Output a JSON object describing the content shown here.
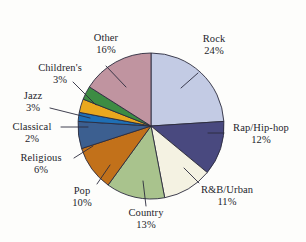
{
  "chart_data": {
    "type": "pie",
    "title": "",
    "subtitle": "",
    "xlabel": "",
    "ylabel": "",
    "units": "percent",
    "legend_position": "none",
    "grid": false,
    "labels_show_percent": true,
    "categories": [
      "Rock",
      "Rap/Hip-hop",
      "R&B/Urban",
      "Country",
      "Pop",
      "Religious",
      "Classical",
      "Jazz",
      "Children's",
      "Other"
    ],
    "values": [
      24,
      12,
      11,
      13,
      10,
      6,
      2,
      3,
      3,
      16
    ],
    "colors": [
      "#c3cbe4",
      "#49497f",
      "#f4f2e2",
      "#a9c38d",
      "#c2711a",
      "#3c5f90",
      "#1f6fb5",
      "#eaa81e",
      "#3d8c43",
      "#c094a0"
    ],
    "slices": [
      {
        "name": "Rock",
        "value": 24,
        "percent_label": "24%",
        "color": "#c3cbe4"
      },
      {
        "name": "Rap/Hip-hop",
        "value": 12,
        "percent_label": "12%",
        "color": "#49497f"
      },
      {
        "name": "R&B/Urban",
        "value": 11,
        "percent_label": "11%",
        "color": "#f4f2e2"
      },
      {
        "name": "Country",
        "value": 13,
        "percent_label": "13%",
        "color": "#a9c38d"
      },
      {
        "name": "Pop",
        "value": 10,
        "percent_label": "10%",
        "color": "#c2711a"
      },
      {
        "name": "Religious",
        "value": 6,
        "percent_label": "6%",
        "color": "#3c5f90"
      },
      {
        "name": "Classical",
        "value": 2,
        "percent_label": "2%",
        "color": "#1f6fb5"
      },
      {
        "name": "Jazz",
        "value": 3,
        "percent_label": "3%",
        "color": "#eaa81e"
      },
      {
        "name": "Children's",
        "value": 3,
        "percent_label": "3%",
        "color": "#3d8c43"
      },
      {
        "name": "Other",
        "value": 16,
        "percent_label": "16%",
        "color": "#c094a0"
      }
    ]
  },
  "labels": {
    "rock": {
      "name": "Rock",
      "percent": "24%"
    },
    "rap_hip_hop": {
      "name": "Rap/Hip-hop",
      "percent": "12%"
    },
    "rnb_urban": {
      "name": "R&B/Urban",
      "percent": "11%"
    },
    "country": {
      "name": "Country",
      "percent": "13%"
    },
    "pop": {
      "name": "Pop",
      "percent": "10%"
    },
    "religious": {
      "name": "Religious",
      "percent": "6%"
    },
    "classical": {
      "name": "Classical",
      "percent": "2%"
    },
    "jazz": {
      "name": "Jazz",
      "percent": "3%"
    },
    "childrens": {
      "name": "Children's",
      "percent": "3%"
    },
    "other": {
      "name": "Other",
      "percent": "16%"
    }
  }
}
